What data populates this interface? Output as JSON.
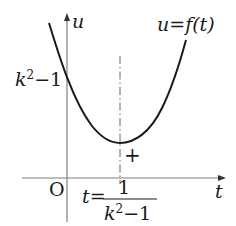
{
  "diagram": {
    "type": "function-graph",
    "axes": {
      "vertical_label": "u",
      "horizontal_label": "t",
      "origin_label": "O"
    },
    "curve": {
      "label_lhs": "u",
      "label_eq": "=",
      "label_rhs": "f(t)",
      "shape": "upward parabola with minimum to the right of the u-axis"
    },
    "u_intercept_label": {
      "base": "k",
      "exponent": "2",
      "rest": "−1"
    },
    "vertex_line": {
      "style": "dash-dot",
      "t_label_lhs": "t",
      "t_label_eq": "=",
      "numerator": "1",
      "denominator_base": "k",
      "denominator_exponent": "2",
      "denominator_rest": "−1"
    },
    "marker": "+",
    "colors": {
      "curve": "#1a1a1a",
      "axis": "#808080",
      "text": "#1a1a1a"
    }
  }
}
